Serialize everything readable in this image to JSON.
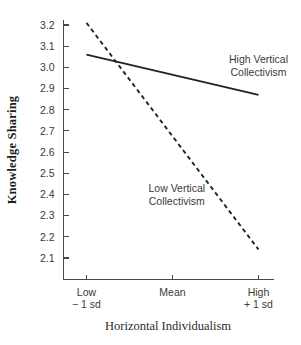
{
  "chart_data": {
    "type": "line",
    "title": "",
    "xlabel": "Horizontal Individualism",
    "ylabel": "Knowledge Sharing",
    "x": [
      "Low\n− 1 sd",
      "Mean",
      "High\n+ 1 sd"
    ],
    "categories": [
      "Low - 1 sd",
      "Mean",
      "High + 1 sd"
    ],
    "xtick_labels": [
      {
        "line1": "Low",
        "line2": "− 1 sd"
      },
      {
        "line1": "Mean",
        "line2": ""
      },
      {
        "line1": "High",
        "line2": "+ 1 sd"
      }
    ],
    "ylim": [
      2.1,
      3.2
    ],
    "yticks": [
      "3.2",
      "3.1",
      "3.0",
      "2.9",
      "2.8",
      "2.7",
      "2.6",
      "2.5",
      "2.4",
      "2.3",
      "2.2",
      "2.1"
    ],
    "ytick_values": [
      3.2,
      3.1,
      3.0,
      2.9,
      2.8,
      2.7,
      2.6,
      2.5,
      2.4,
      2.3,
      2.2,
      2.1
    ],
    "grid": false,
    "legend_position": "inline-annotation",
    "series": [
      {
        "name": "High Vertical Collectivism",
        "style": "solid",
        "color": "#222222",
        "label_lines": [
          "High Vertical",
          "Collectivism"
        ],
        "label_x_value": 2.38,
        "label_y_value": 3.02,
        "x_values": [
          0,
          2
        ],
        "values": [
          3.06,
          2.87
        ]
      },
      {
        "name": "Low Vertical Collectivism",
        "style": "dashed",
        "color": "#222222",
        "label_lines": [
          "Low Vertical",
          "Collectivism"
        ],
        "label_x_value": 1.05,
        "label_y_value": 2.41,
        "x_values": [
          0,
          2
        ],
        "values": [
          3.21,
          2.14
        ]
      }
    ]
  },
  "axes": {
    "y_title": "Knowledge Sharing",
    "x_title": "Horizontal Individualism"
  },
  "colors": {
    "axis": "#4a4a4a",
    "line": "#222222",
    "text": "#3a3a3a",
    "title": "#1d1d1d",
    "background": "#ffffff"
  }
}
